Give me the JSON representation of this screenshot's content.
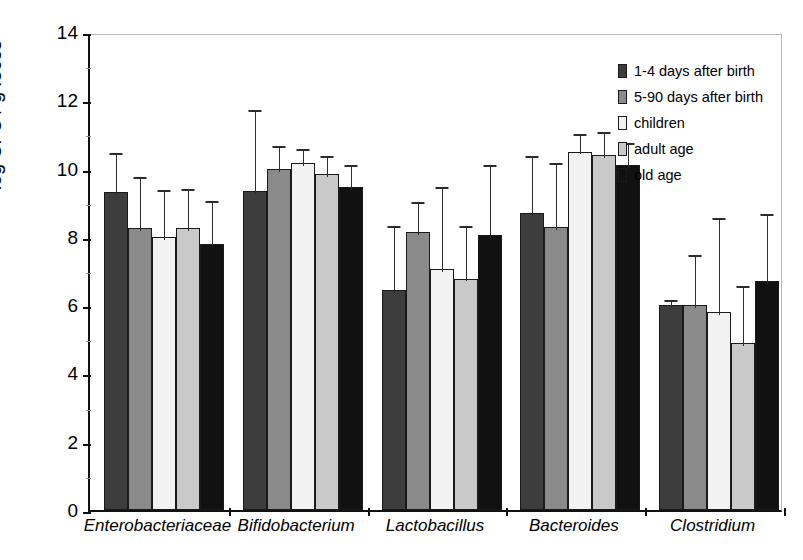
{
  "chart_data": {
    "type": "bar",
    "title": "",
    "xlabel": "",
    "ylabel": "log CFU / g feces",
    "ylim": [
      0,
      14
    ],
    "ytick_values": [
      0,
      2,
      4,
      6,
      8,
      10,
      12,
      14
    ],
    "ytick_labels": [
      "0",
      "2",
      "4",
      "6",
      "8",
      "10",
      "12",
      "14"
    ],
    "yminor_step": 1,
    "grid": false,
    "legend_position": "top-right",
    "orientation": "vertical",
    "error_bars": "upper-only",
    "categories": [
      "Enterobacteriaceae",
      "Bifidobacterium",
      "Lactobacillus",
      "Bacteroides",
      "Clostridium"
    ],
    "series": [
      {
        "name": "1-4 days after birth",
        "color": "#3d3d3d",
        "values": [
          9.3,
          9.35,
          6.45,
          8.7,
          6.0
        ],
        "err_upper": [
          10.55,
          11.8,
          8.4,
          10.45,
          6.25
        ]
      },
      {
        "name": "5-90 days after birth",
        "color": "#8a8a8a",
        "values": [
          8.25,
          10.0,
          8.15,
          8.3,
          6.0
        ],
        "err_upper": [
          9.85,
          10.75,
          9.1,
          10.25,
          7.55
        ]
      },
      {
        "name": "children",
        "color": "#f2f2f2",
        "values": [
          8.0,
          10.15,
          7.05,
          10.5,
          5.8
        ],
        "err_upper": [
          9.45,
          10.65,
          9.55,
          11.1,
          8.65
        ]
      },
      {
        "name": "adult age",
        "color": "#c9c9c9",
        "values": [
          8.25,
          9.85,
          6.78,
          10.4,
          4.9
        ],
        "err_upper": [
          9.5,
          10.45,
          8.4,
          11.15,
          6.65
        ]
      },
      {
        "name": "old age",
        "color": "#111111",
        "values": [
          7.8,
          9.45,
          8.05,
          10.1,
          6.7
        ],
        "err_upper": [
          9.15,
          10.2,
          10.2,
          10.85,
          8.75
        ]
      }
    ]
  },
  "legend": {
    "items": [
      {
        "label": "1-4 days after birth",
        "color": "#3d3d3d"
      },
      {
        "label": "5-90 days after birth",
        "color": "#8a8a8a"
      },
      {
        "label": "children",
        "color": "#f2f2f2"
      },
      {
        "label": "adult age",
        "color": "#c9c9c9"
      },
      {
        "label": "old age",
        "color": "#111111"
      }
    ]
  }
}
